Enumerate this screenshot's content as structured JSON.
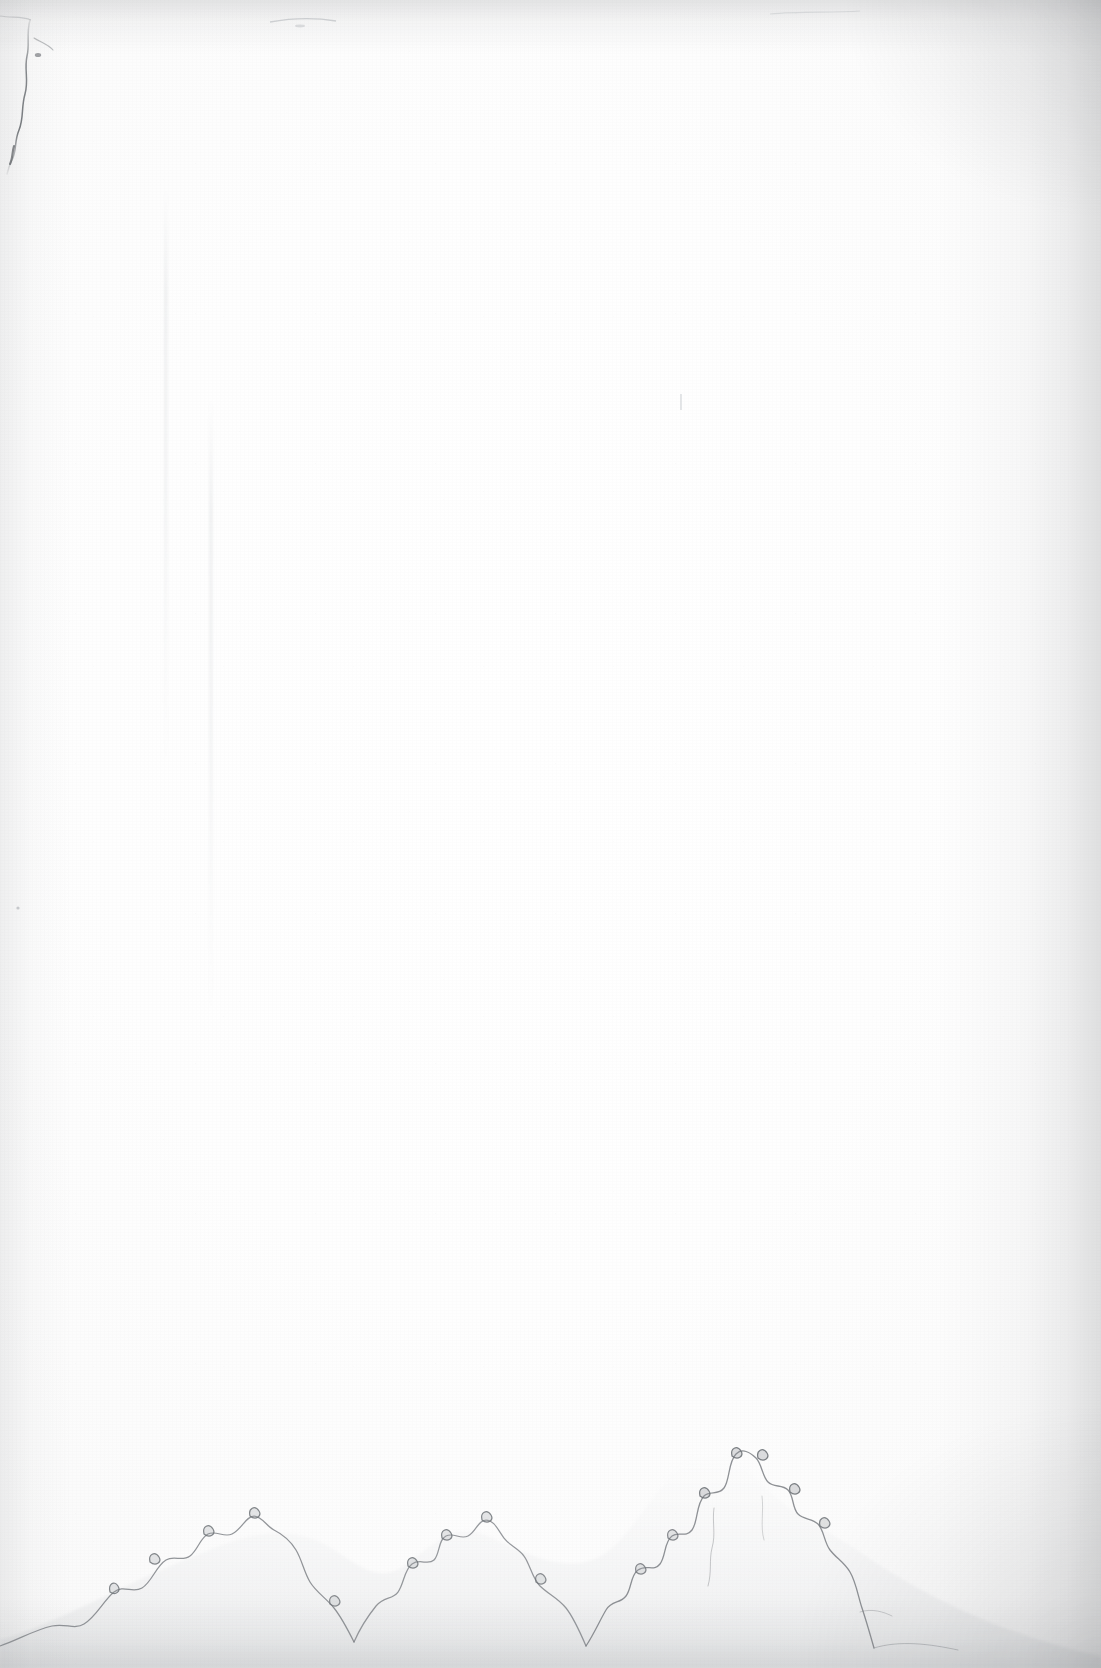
{
  "page": {
    "kind": "scanned-blank-page",
    "width_px": 1101,
    "height_px": 1668,
    "caption": "",
    "visible_text": ""
  },
  "colors": {
    "paper_white": "#fdfdfd",
    "paper_highlight": "#ffffff",
    "paper_shade": "#f6f6f6",
    "edge_shadow": "#eeeeee",
    "vignette_gray": "#787a7e",
    "stain_line": "#6f7378",
    "stain_fill": "#f3f4f5",
    "crack_line": "#5c6065",
    "crease_line": "#f2f2f3"
  },
  "features": {
    "torn_edge": {
      "name": "torn-deckle-edge-upper-left",
      "label": "",
      "edge": "left",
      "start_y": 22,
      "end_y": 168
    },
    "creases": [
      {
        "name": "vertical-crease-left",
        "x": 166,
        "top": 190,
        "bottom": 760
      },
      {
        "name": "vertical-crease-right",
        "x": 211,
        "top": 400,
        "bottom": 1010
      }
    ],
    "specks": [
      {
        "name": "speck-top-left",
        "x": 38,
        "y": 55
      },
      {
        "name": "speck-top-center",
        "x": 300,
        "y": 14
      },
      {
        "name": "speck-mid-right",
        "x": 681,
        "y": 401
      },
      {
        "name": "speck-left-low",
        "x": 18,
        "y": 908
      }
    ],
    "stains": [
      {
        "name": "tide-stain-bottom-left",
        "label": "",
        "x_from": 60,
        "x_to": 340,
        "peak_y": 1556
      },
      {
        "name": "tide-stain-bottom-center",
        "label": "",
        "x_from": 180,
        "x_to": 420,
        "peak_y": 1500
      },
      {
        "name": "tide-stain-bottom-right",
        "label": "",
        "x_from": 620,
        "x_to": 800,
        "peak_y": 1452
      }
    ]
  }
}
